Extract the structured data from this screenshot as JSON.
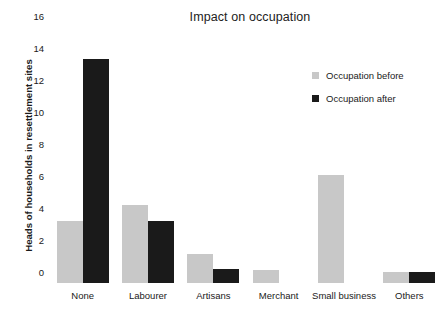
{
  "chart_data": {
    "type": "bar",
    "title": "Impact on occupation",
    "xlabel": "",
    "ylabel": "Heads of households in resettlement sites",
    "ylim": [
      0,
      16
    ],
    "yticks": [
      0,
      2,
      4,
      6,
      8,
      10,
      12,
      14,
      16
    ],
    "grid": false,
    "legend_position": "right",
    "categories": [
      "None",
      "Labourer",
      "Artisans",
      "Merchant",
      "Small business",
      "Others"
    ],
    "series": [
      {
        "name": "Occupation before",
        "color": "#c8c8c8",
        "values": [
          3.9,
          4.9,
          1.8,
          0.8,
          6.75,
          0.7
        ]
      },
      {
        "name": "Occupation after",
        "color": "#1a1a1a",
        "values": [
          14,
          3.85,
          0.85,
          0,
          0,
          0.7
        ]
      }
    ]
  }
}
